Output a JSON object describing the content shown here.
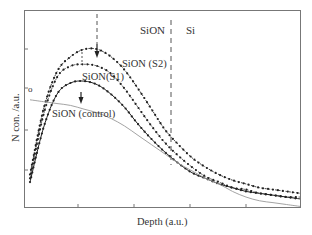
{
  "chart_data": {
    "type": "line",
    "title": "",
    "xlabel": "Depth (a.u.)",
    "ylabel": "N con. /a.u.",
    "grid": false,
    "legend": "inline annotations",
    "x_range": [
      0,
      1
    ],
    "y_range": [
      0,
      1
    ],
    "region_labels": [
      {
        "text": "SiON",
        "x": 0.47
      },
      {
        "text": "Si",
        "x": 0.59
      }
    ],
    "interface_x": 0.53,
    "annotations": [
      {
        "text": "o",
        "series": "reference"
      },
      {
        "text": "SiON (S2)"
      },
      {
        "text": "SiON(S1)"
      },
      {
        "text": "SiON (control)"
      }
    ],
    "x": [
      0.0,
      0.05,
      0.1,
      0.15,
      0.2,
      0.25,
      0.3,
      0.35,
      0.4,
      0.45,
      0.5,
      0.55,
      0.6,
      0.65,
      0.7,
      0.75,
      0.8,
      0.85,
      0.9,
      0.95,
      1.0
    ],
    "series": [
      {
        "name": "SiON (S2)",
        "marker": "dot",
        "dashed": true,
        "values": [
          0.2,
          0.55,
          0.75,
          0.83,
          0.87,
          0.87,
          0.83,
          0.76,
          0.66,
          0.55,
          0.44,
          0.36,
          0.29,
          0.24,
          0.2,
          0.17,
          0.15,
          0.13,
          0.12,
          0.11,
          0.1
        ]
      },
      {
        "name": "SiON(S1)",
        "marker": "dot",
        "dashed": true,
        "values": [
          0.18,
          0.52,
          0.72,
          0.78,
          0.79,
          0.78,
          0.74,
          0.66,
          0.56,
          0.46,
          0.37,
          0.3,
          0.24,
          0.19,
          0.16,
          0.13,
          0.12,
          0.1,
          0.09,
          0.08,
          0.08
        ]
      },
      {
        "name": "SiON (control)",
        "marker": "dot",
        "dashed": false,
        "values": [
          0.16,
          0.45,
          0.63,
          0.69,
          0.7,
          0.68,
          0.63,
          0.56,
          0.47,
          0.39,
          0.32,
          0.26,
          0.21,
          0.18,
          0.15,
          0.13,
          0.11,
          0.1,
          0.09,
          0.08,
          0.07
        ]
      },
      {
        "name": "reference (o)",
        "marker": "none",
        "dashed": false,
        "values": [
          0.6,
          0.59,
          0.58,
          0.57,
          0.55,
          0.53,
          0.5,
          0.46,
          0.41,
          0.36,
          0.31,
          0.26,
          0.22,
          0.18,
          0.15,
          0.11,
          0.08,
          0.06,
          0.05,
          0.04,
          0.03
        ]
      }
    ]
  },
  "labels": {
    "sion_region": "SiON",
    "si_region": "Si",
    "s2": "SiON (S2)",
    "s1": "SiON(S1)",
    "control": "SiON (control)",
    "origin": "o",
    "xlabel": "Depth (a.u.)",
    "ylabel": "N con. /a.u."
  }
}
